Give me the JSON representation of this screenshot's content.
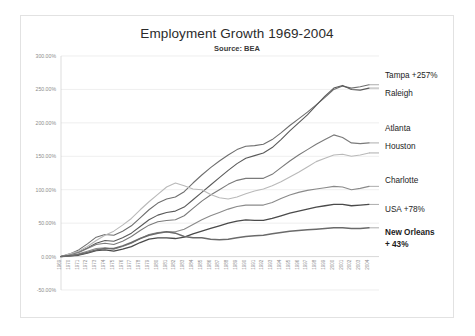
{
  "chart_data": {
    "type": "line",
    "title": "Employment Growth 1969-2004",
    "subtitle": "Source: BEA",
    "xlabel": "",
    "ylabel": "",
    "ylim": [
      -50,
      300
    ],
    "yticks": [
      300,
      250,
      200,
      150,
      100,
      50,
      0,
      -50
    ],
    "ytick_labels": [
      "300.00%",
      "250.00%",
      "200.00%",
      "150.00%",
      "100.00%",
      "50.00%",
      "0.00%",
      "-50.00%"
    ],
    "grid": true,
    "legend_position": "right-inline-labels",
    "x": [
      1969,
      1970,
      1971,
      1972,
      1973,
      1974,
      1975,
      1976,
      1977,
      1978,
      1979,
      1980,
      1981,
      1982,
      1983,
      1984,
      1985,
      1986,
      1987,
      1988,
      1989,
      1990,
      1991,
      1992,
      1993,
      1994,
      1995,
      1996,
      1997,
      1998,
      1999,
      2000,
      2001,
      2002,
      2003,
      2004
    ],
    "xtick_labels": [
      "1969",
      "1970",
      "1971",
      "1972",
      "1973",
      "1974",
      "1975",
      "1976",
      "1977",
      "1978",
      "1979",
      "1980",
      "1981",
      "1982",
      "1983",
      "1984",
      "1985",
      "1986",
      "1987",
      "1988",
      "1989",
      "1990",
      "1991",
      "1992",
      "1993",
      "1994",
      "1995",
      "1996",
      "1997",
      "1998",
      "1999",
      "2000",
      "2001",
      "2002",
      "2003",
      "2004"
    ],
    "series": [
      {
        "name": "Tampa",
        "label": "Tampa +257%",
        "color": "#6e6e6e",
        "width": 1.1,
        "bold_label": false,
        "end_value": 257,
        "values": [
          0,
          4,
          10,
          19,
          29,
          33,
          32,
          38,
          46,
          58,
          70,
          80,
          86,
          89,
          97,
          110,
          122,
          133,
          143,
          152,
          160,
          165,
          166,
          168,
          175,
          185,
          196,
          206,
          216,
          227,
          238,
          250,
          255,
          252,
          254,
          257
        ]
      },
      {
        "name": "Raleigh",
        "label": "Raleigh",
        "color": "#5a5a5a",
        "width": 1.1,
        "bold_label": false,
        "end_value": 252,
        "values": [
          0,
          3,
          7,
          13,
          20,
          24,
          23,
          28,
          35,
          45,
          55,
          62,
          66,
          68,
          74,
          85,
          96,
          107,
          118,
          129,
          139,
          147,
          151,
          155,
          163,
          175,
          188,
          200,
          212,
          226,
          240,
          252,
          256,
          250,
          249,
          252
        ]
      },
      {
        "name": "Atlanta",
        "label": "Atlanta",
        "color": "#7a7a7a",
        "width": 1.1,
        "bold_label": false,
        "end_value": 170,
        "values": [
          0,
          3,
          6,
          12,
          18,
          20,
          18,
          23,
          30,
          39,
          47,
          52,
          54,
          55,
          61,
          72,
          83,
          92,
          100,
          108,
          114,
          117,
          117,
          117,
          123,
          133,
          143,
          152,
          160,
          168,
          175,
          182,
          178,
          170,
          169,
          170
        ]
      },
      {
        "name": "Houston",
        "label": "Houston",
        "color": "#b9b9b9",
        "width": 1.1,
        "bold_label": false,
        "end_value": 155,
        "values": [
          0,
          4,
          8,
          15,
          24,
          32,
          38,
          47,
          57,
          70,
          82,
          93,
          104,
          110,
          106,
          101,
          100,
          93,
          88,
          86,
          89,
          94,
          98,
          101,
          106,
          112,
          119,
          126,
          134,
          142,
          147,
          152,
          153,
          150,
          152,
          155
        ]
      },
      {
        "name": "Charlotte",
        "label": "Charlotte",
        "color": "#8a8a8a",
        "width": 1.1,
        "bold_label": false,
        "end_value": 105,
        "values": [
          0,
          2,
          4,
          8,
          12,
          13,
          11,
          15,
          20,
          27,
          33,
          36,
          37,
          37,
          41,
          48,
          55,
          61,
          66,
          71,
          75,
          77,
          77,
          77,
          81,
          87,
          92,
          96,
          99,
          101,
          103,
          105,
          104,
          100,
          102,
          105
        ]
      },
      {
        "name": "USA",
        "label": "USA +78%",
        "color": "#4a4a4a",
        "width": 1.3,
        "bold_label": false,
        "end_value": 78,
        "values": [
          0,
          1,
          2,
          5,
          9,
          10,
          8,
          11,
          15,
          21,
          26,
          28,
          28,
          27,
          29,
          34,
          38,
          42,
          46,
          50,
          53,
          55,
          54,
          54,
          57,
          61,
          65,
          68,
          71,
          74,
          76,
          78,
          78,
          76,
          77,
          78
        ]
      },
      {
        "name": "New Orleans",
        "label": "New Orleans + 43%",
        "color": "#6a6a6a",
        "width": 1.5,
        "bold_label": true,
        "end_value": 43,
        "values": [
          0,
          1,
          3,
          6,
          10,
          12,
          12,
          16,
          21,
          27,
          32,
          35,
          37,
          35,
          30,
          28,
          28,
          26,
          25,
          26,
          28,
          30,
          31,
          32,
          34,
          36,
          38,
          39,
          40,
          41,
          42,
          43,
          43,
          42,
          42,
          43
        ]
      }
    ],
    "annotations": [
      {
        "text": "Tampa +257%",
        "series": "Tampa"
      },
      {
        "text": "Raleigh",
        "series": "Raleigh"
      },
      {
        "text": "Atlanta",
        "series": "Atlanta"
      },
      {
        "text": "Houston",
        "series": "Houston"
      },
      {
        "text": "Charlotte",
        "series": "Charlotte"
      },
      {
        "text": "USA +78%",
        "series": "USA"
      },
      {
        "text": "New Orleans + 43%",
        "series": "New Orleans"
      }
    ],
    "labels_layout": [
      {
        "name": "Tampa",
        "label": "Tampa +257%",
        "x": 384,
        "y": 77,
        "bold": false
      },
      {
        "name": "Raleigh",
        "label": "Raleigh",
        "x": 384,
        "y": 95,
        "bold": false
      },
      {
        "name": "Atlanta",
        "label": "Atlanta",
        "x": 384,
        "y": 130,
        "bold": false
      },
      {
        "name": "Houston",
        "label": "Houston",
        "x": 384,
        "y": 148,
        "bold": false
      },
      {
        "name": "Charlotte",
        "label": "Charlotte",
        "x": 384,
        "y": 182,
        "bold": false
      },
      {
        "name": "USA",
        "label": "USA +78%",
        "x": 384,
        "y": 211,
        "bold": false
      },
      {
        "name": "New Orleans",
        "label": "New Orleans",
        "x": 384,
        "y": 234,
        "bold": true
      },
      {
        "name": "New Orleans Pct",
        "label": "+ 43%",
        "x": 384,
        "y": 246,
        "bold": true
      }
    ]
  }
}
